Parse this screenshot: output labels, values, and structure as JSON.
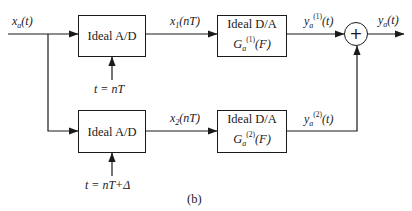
{
  "figure": {
    "caption": "(b)",
    "input_signal": {
      "base": "x",
      "sub": "a",
      "arg": "(t)"
    },
    "output_signal": {
      "base": "y",
      "sub": "a",
      "arg": "(t)"
    },
    "adder_symbol": "+",
    "branches": [
      {
        "adc_label": "Ideal A/D",
        "sampling_label": "t = nT",
        "sample_signal": {
          "base": "x",
          "sub": "1",
          "arg": "(nT)"
        },
        "dac_label": "Ideal D/A",
        "dac_transfer": {
          "base": "G",
          "sub": "a",
          "sup": "(1)",
          "arg": "(F)"
        },
        "dac_output": {
          "base": "y",
          "sub": "a",
          "sup": "(1)",
          "arg": "(t)"
        }
      },
      {
        "adc_label": "Ideal A/D",
        "sampling_label": "t = nT+Δ",
        "sample_signal": {
          "base": "x",
          "sub": "2",
          "arg": "(nT)"
        },
        "dac_label": "Ideal D/A",
        "dac_transfer": {
          "base": "G",
          "sub": "a",
          "sup": "(2)",
          "arg": "(F)"
        },
        "dac_output": {
          "base": "y",
          "sub": "a",
          "sup": "(2)",
          "arg": "(t)"
        }
      }
    ]
  }
}
